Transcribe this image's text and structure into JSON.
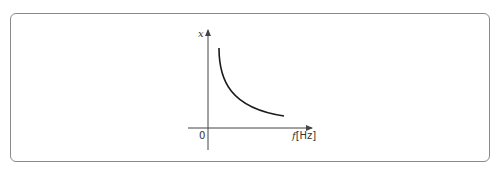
{
  "diagram": {
    "y_axis_label": "x",
    "x_axis_var": "f",
    "x_axis_unit": "[Hz]",
    "origin_label": "0",
    "curve": "decreasing hyperbolic curve (inverse relation x ∝ 1/f)",
    "colors": {
      "axis": "#444444",
      "curve": "#1a1a1a",
      "frame": "#8a8a8a"
    }
  }
}
